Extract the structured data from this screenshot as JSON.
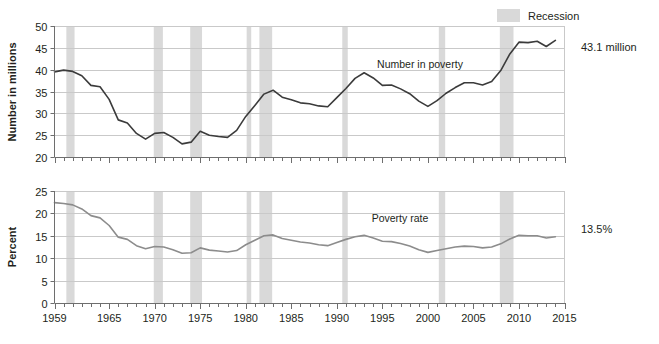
{
  "legend": {
    "swatch_color": "#d9d9d9",
    "label": "Recession"
  },
  "chart_data": [
    {
      "type": "line",
      "id": "number-in-poverty",
      "title": "",
      "xlabel": "",
      "ylabel": "Number in millions",
      "series_label": "Number in poverty",
      "end_label": "43.1 million",
      "line_color": "#3b3b3b",
      "xlim": [
        1959,
        2015
      ],
      "ylim": [
        20,
        50
      ],
      "yticks": [
        20,
        25,
        30,
        35,
        40,
        45,
        50
      ],
      "xticks": [
        1959,
        1965,
        1970,
        1975,
        1980,
        1985,
        1990,
        1995,
        2000,
        2005,
        2010,
        2015
      ],
      "grid": true,
      "legend_position": "top-right",
      "x": [
        1959,
        1960,
        1961,
        1962,
        1963,
        1964,
        1965,
        1966,
        1967,
        1968,
        1969,
        1970,
        1971,
        1972,
        1973,
        1974,
        1975,
        1976,
        1977,
        1978,
        1979,
        1980,
        1981,
        1982,
        1983,
        1984,
        1985,
        1986,
        1987,
        1988,
        1989,
        1990,
        1991,
        1992,
        1993,
        1994,
        1995,
        1996,
        1997,
        1998,
        1999,
        2000,
        2001,
        2002,
        2003,
        2004,
        2005,
        2006,
        2007,
        2008,
        2009,
        2010,
        2011,
        2012,
        2013,
        2014
      ],
      "values": [
        39.5,
        39.9,
        39.6,
        38.6,
        36.4,
        36.1,
        33.2,
        28.5,
        27.8,
        25.4,
        24.1,
        25.4,
        25.6,
        24.5,
        23.0,
        23.4,
        25.9,
        25.0,
        24.7,
        24.5,
        26.1,
        29.3,
        31.8,
        34.4,
        35.3,
        33.7,
        33.1,
        32.4,
        32.2,
        31.7,
        31.5,
        33.6,
        35.7,
        38.0,
        39.3,
        38.1,
        36.4,
        36.5,
        35.6,
        34.5,
        32.8,
        31.6,
        32.9,
        34.6,
        35.9,
        37.0,
        37.0,
        36.5,
        37.3,
        39.8,
        43.6,
        46.3,
        46.2,
        46.5,
        45.3,
        46.7
      ]
    },
    {
      "type": "line",
      "id": "poverty-rate",
      "title": "",
      "xlabel": "",
      "ylabel": "Percent",
      "series_label": "Poverty rate",
      "end_label": "13.5%",
      "line_color": "#8c8c8c",
      "xlim": [
        1959,
        2015
      ],
      "ylim": [
        0,
        25
      ],
      "yticks": [
        0,
        5,
        10,
        15,
        20,
        25
      ],
      "xticks": [
        1959,
        1965,
        1970,
        1975,
        1980,
        1985,
        1990,
        1995,
        2000,
        2005,
        2010,
        2015
      ],
      "grid": true,
      "x": [
        1959,
        1960,
        1961,
        1962,
        1963,
        1964,
        1965,
        1966,
        1967,
        1968,
        1969,
        1970,
        1971,
        1972,
        1973,
        1974,
        1975,
        1976,
        1977,
        1978,
        1979,
        1980,
        1981,
        1982,
        1983,
        1984,
        1985,
        1986,
        1987,
        1988,
        1989,
        1990,
        1991,
        1992,
        1993,
        1994,
        1995,
        1996,
        1997,
        1998,
        1999,
        2000,
        2001,
        2002,
        2003,
        2004,
        2005,
        2006,
        2007,
        2008,
        2009,
        2010,
        2011,
        2012,
        2013,
        2014
      ],
      "values": [
        22.4,
        22.2,
        21.9,
        21.0,
        19.5,
        19.0,
        17.3,
        14.7,
        14.2,
        12.8,
        12.1,
        12.6,
        12.5,
        11.9,
        11.1,
        11.2,
        12.3,
        11.8,
        11.6,
        11.4,
        11.7,
        13.0,
        14.0,
        15.0,
        15.2,
        14.4,
        14.0,
        13.6,
        13.4,
        13.0,
        12.8,
        13.5,
        14.2,
        14.8,
        15.1,
        14.5,
        13.8,
        13.7,
        13.3,
        12.7,
        11.9,
        11.3,
        11.7,
        12.1,
        12.5,
        12.7,
        12.6,
        12.3,
        12.5,
        13.2,
        14.3,
        15.1,
        15.0,
        15.0,
        14.5,
        14.8
      ]
    }
  ],
  "recessions": [
    {
      "start": 1960.3,
      "end": 1961.2
    },
    {
      "start": 1969.9,
      "end": 1970.9
    },
    {
      "start": 1973.9,
      "end": 1975.2
    },
    {
      "start": 1980.1,
      "end": 1980.6
    },
    {
      "start": 1981.5,
      "end": 1982.9
    },
    {
      "start": 1990.6,
      "end": 1991.2
    },
    {
      "start": 2001.2,
      "end": 2001.9
    },
    {
      "start": 2007.9,
      "end": 2009.4
    }
  ]
}
